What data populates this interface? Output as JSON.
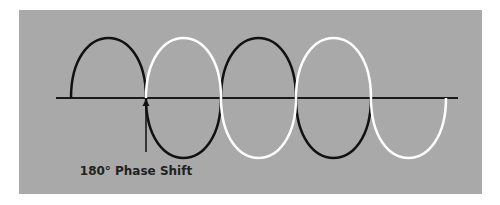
{
  "diagram": {
    "background_color": "#a9a9a9",
    "axis_color": "#1a1a1a",
    "wave_a": {
      "name": "reference-wave",
      "color": "#111111"
    },
    "wave_b": {
      "name": "shifted-wave",
      "color": "#ffffff"
    },
    "annotation": {
      "label": "180° Phase Shift",
      "points_to": "first zero crossing where the shifted wave begins"
    }
  }
}
